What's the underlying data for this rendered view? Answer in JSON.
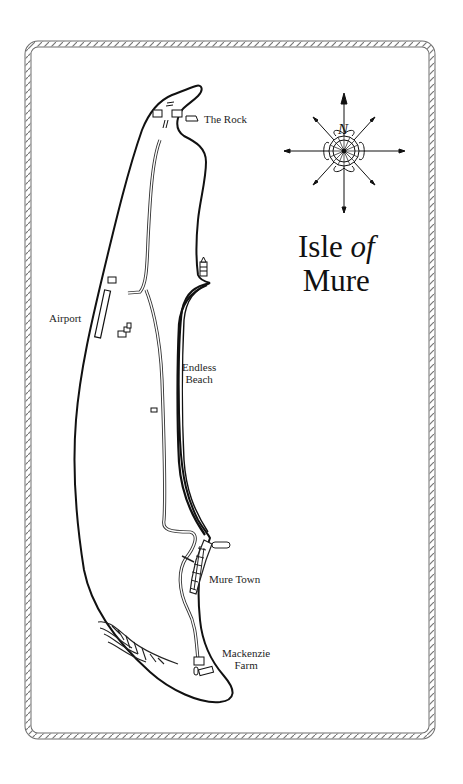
{
  "map": {
    "title_line1_a": "Isle ",
    "title_line1_b": "of",
    "title_line2": "Mure",
    "compass": {
      "north_label": "N"
    },
    "places": [
      {
        "name": "The Rock"
      },
      {
        "name": "Airport"
      },
      {
        "name": "Endless",
        "name2": "Beach"
      },
      {
        "name": "Mure Town"
      },
      {
        "name": "Mackenzie",
        "name2": "Farm"
      }
    ],
    "colors": {
      "ink": "#1a1a1a",
      "border": "#6e6e6e",
      "background": "#ffffff"
    }
  }
}
